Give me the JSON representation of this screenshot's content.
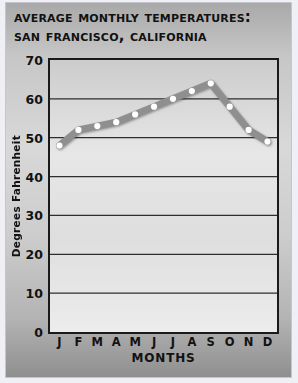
{
  "title": {
    "line1": "Average Monthly Temperatures:",
    "line2": "San Francisco, California"
  },
  "chart_data": {
    "type": "line",
    "title": "Average Monthly Temperatures: San Francisco, California",
    "categories": [
      "J",
      "F",
      "M",
      "A",
      "M",
      "J",
      "J",
      "A",
      "S",
      "O",
      "N",
      "D"
    ],
    "values": [
      48,
      52,
      53,
      54,
      56,
      58,
      60,
      62,
      64,
      58,
      52,
      49
    ],
    "xlabel": "MONTHS",
    "ylabel": "Degrees Fahrenheit",
    "ylim": [
      0,
      70
    ],
    "yticks": [
      0,
      10,
      20,
      30,
      40,
      50,
      60,
      70
    ],
    "grid": true,
    "legend_position": "none"
  },
  "colors": {
    "page_bg": "#eef0f5",
    "panel_top": "#a9a9a9",
    "panel_mid": "#d8d8d8",
    "panel_bottom": "#8f8f8f",
    "plot_top": "#cccccc",
    "plot_bottom": "#ececec",
    "grid_color": "#2e2e2e",
    "axis_color": "#1a1a1a",
    "text_color": "#121212",
    "line_color": "#8f8f8f",
    "marker_color": "#ffffff"
  }
}
